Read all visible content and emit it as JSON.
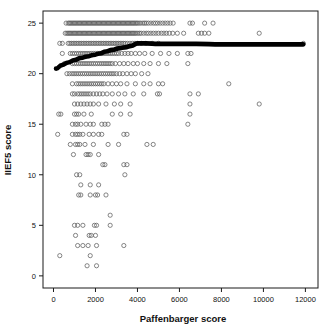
{
  "chart_data": {
    "type": "scatter",
    "title": "",
    "xlabel": "Paffenbarger score",
    "ylabel": "IIEF5 score",
    "xlim": [
      -500,
      12600
    ],
    "ylim": [
      -1.2,
      26.2
    ],
    "xticks": [
      0,
      2000,
      4000,
      6000,
      8000,
      10000,
      12000
    ],
    "xtick_labels": [
      "0",
      "2000",
      "4000",
      "6000",
      "8000",
      "10000",
      "12000"
    ],
    "yticks": [
      0,
      5,
      10,
      15,
      20,
      25
    ],
    "ytick_labels": [
      "0",
      "5",
      "10",
      "15",
      "20",
      "25"
    ],
    "grid": false,
    "legend": null,
    "marker": "open-circle",
    "marker_color": "#5d5d5d",
    "frame_color": "#1b1b1b",
    "trend_color": "#000000",
    "series": [
      {
        "name": "IIEF5 vs Paffenbarger",
        "points_by_y": {
          "25": [
            600,
            700,
            760,
            820,
            880,
            940,
            1000,
            1060,
            1120,
            1180,
            1240,
            1300,
            1360,
            1420,
            1480,
            1540,
            1600,
            1660,
            1720,
            1780,
            1840,
            1900,
            1960,
            2020,
            2080,
            2140,
            2200,
            2260,
            2320,
            2380,
            2440,
            2500,
            2560,
            2620,
            2680,
            2740,
            2800,
            2860,
            2920,
            2980,
            3040,
            3100,
            3160,
            3220,
            3280,
            3340,
            3400,
            3460,
            3520,
            3580,
            3640,
            3700,
            3760,
            3820,
            3880,
            3940,
            4000,
            4080,
            4160,
            4260,
            4340,
            4420,
            4520,
            4640,
            4760,
            4860,
            4960,
            5080,
            5200,
            5320,
            5440,
            5560,
            5700,
            6500,
            6620,
            7200,
            7600
          ],
          "24": [
            560,
            640,
            700,
            760,
            820,
            880,
            940,
            1000,
            1060,
            1120,
            1180,
            1240,
            1300,
            1360,
            1420,
            1480,
            1540,
            1600,
            1660,
            1720,
            1780,
            1840,
            1900,
            1960,
            2020,
            2080,
            2140,
            2200,
            2260,
            2320,
            2380,
            2440,
            2500,
            2560,
            2620,
            2680,
            2740,
            2800,
            2860,
            2920,
            2980,
            3040,
            3100,
            3160,
            3220,
            3280,
            3340,
            3400,
            3460,
            3520,
            3580,
            3640,
            3700,
            3760,
            3820,
            3880,
            3940,
            4020,
            4100,
            4180,
            4300,
            4420,
            4520,
            4640,
            4760,
            4880,
            5000,
            5140,
            5260,
            5380,
            5520,
            5680,
            5900,
            6200,
            6900,
            7050,
            7200,
            7400,
            9800
          ],
          "23": [
            300,
            420,
            700,
            780,
            860,
            940,
            1020,
            1100,
            1180,
            1260,
            1340,
            1420,
            1500,
            1580,
            1660,
            1740,
            1820,
            1900,
            1980,
            2060,
            2140,
            2220,
            2300,
            2380,
            2460,
            2540,
            2620,
            2700,
            2780,
            2860,
            2940,
            3020,
            3100,
            3180,
            3260,
            3340,
            3420,
            3520,
            3640,
            3760,
            3880,
            4000,
            4180,
            4400,
            4700,
            5000,
            11900
          ],
          "22": [
            420,
            800,
            900,
            1000,
            1100,
            1200,
            1300,
            1400,
            1500,
            1600,
            1700,
            1800,
            1900,
            2000,
            2100,
            2200,
            2300,
            2400,
            2500,
            2600,
            2700,
            2800,
            2900,
            3000,
            3100,
            3250,
            3400,
            3550,
            3700,
            3900,
            4100,
            4350,
            4700,
            5100,
            5500,
            5900,
            6400,
            6550
          ],
          "21": [
            520,
            900,
            1000,
            1100,
            1200,
            1300,
            1400,
            1500,
            1600,
            1700,
            1800,
            1900,
            2000,
            2100,
            2200,
            2300,
            2400,
            2500,
            2600,
            2700,
            2800,
            2950,
            3150,
            3350,
            3550,
            3800,
            4000,
            4300,
            4600,
            5000,
            5400,
            6400
          ],
          "20": [
            640,
            760,
            880,
            980,
            1080,
            1180,
            1280,
            1380,
            1480,
            1580,
            1680,
            1780,
            1880,
            1980,
            2080,
            2180,
            2280,
            2380,
            2480,
            2580,
            2680,
            2780,
            2880,
            3000,
            3150,
            3300,
            3500,
            3700,
            3900,
            4200,
            4500
          ],
          "19": [
            900,
            1100,
            1200,
            1300,
            1400,
            1500,
            1600,
            1700,
            1800,
            1900,
            2000,
            2100,
            2200,
            2300,
            2400,
            2600,
            2800,
            3000,
            3200,
            3500,
            3900,
            4300,
            4600,
            5000,
            5200,
            8350
          ],
          "18": [
            900,
            1000,
            1150,
            1250,
            1350,
            1450,
            1550,
            1650,
            1750,
            1900,
            2050,
            2200,
            2350,
            2550,
            2800,
            3100,
            3400,
            3800,
            4300,
            4950,
            5050,
            6500,
            6900
          ],
          "17": [
            1000,
            1150,
            1300,
            1450,
            1600,
            1750,
            1900,
            2150,
            2500,
            2900,
            3200,
            3650,
            6500,
            9800
          ],
          "16": [
            250,
            350,
            1000,
            1100,
            1200,
            1450,
            1800,
            2800,
            3200,
            3650,
            6500
          ],
          "15": [
            900,
            1050,
            1150,
            1300,
            1550,
            1750,
            1900,
            2300,
            2450,
            2600,
            6400
          ],
          "14": [
            200,
            900,
            1050,
            1150,
            1250,
            1400,
            1700,
            1900,
            2150,
            2300,
            3350,
            3500
          ],
          "13": [
            800,
            1050,
            1150,
            1250,
            1500,
            1900,
            2600,
            3100,
            4450,
            4750
          ],
          "12": [
            950,
            1550,
            1650,
            1750,
            2150
          ],
          "11": [
            2350,
            2450,
            3350,
            3500
          ],
          "10": [
            1100,
            1250,
            3400
          ],
          "9": [
            1300,
            1750,
            2150
          ],
          "8": [
            1200,
            1300,
            1750,
            2000,
            2100,
            2500
          ],
          "6": [
            2700
          ],
          "5": [
            1000,
            1150,
            1400,
            1950,
            2050,
            2700
          ],
          "4": [
            1050,
            1700,
            1800,
            2000
          ],
          "3": [
            1150,
            1400,
            1650,
            2050,
            3350
          ],
          "2": [
            300,
            1750
          ],
          "1": [
            1600,
            2050
          ]
        },
        "n_points_approx": 450
      }
    ],
    "trend": {
      "name": "lowess-smoother",
      "x": [
        120,
        400,
        700,
        1000,
        1300,
        1600,
        1900,
        2200,
        2500,
        2800,
        3100,
        3400,
        3700,
        4000,
        4400,
        5000,
        5800,
        6800,
        8000,
        9500,
        11000,
        11900
      ],
      "y": [
        20.5,
        20.85,
        21.1,
        21.35,
        21.55,
        21.7,
        21.85,
        22.0,
        22.2,
        22.35,
        22.5,
        22.6,
        22.75,
        23.0,
        23.0,
        22.95,
        22.95,
        22.95,
        22.9,
        22.9,
        22.9,
        22.9
      ]
    }
  },
  "axes": {
    "x_title": "Paffenbarger score",
    "y_title": "IIEF5 score"
  }
}
